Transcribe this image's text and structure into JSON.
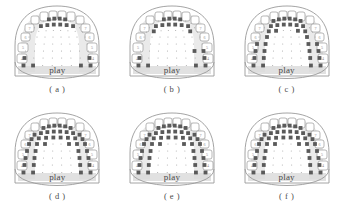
{
  "figure": {
    "type": "electropalatography-palatogram-grid",
    "rows": 2,
    "cols": 3,
    "word": "play",
    "background": "#ffffff",
    "ink": "#4a4a4a",
    "contact_color": "#5a5a5a",
    "outline_color": "#9a9a9a",
    "shade_color": "#d9d9d9"
  },
  "grid_geometry": {
    "rows": 8,
    "cols_per_row": [
      8,
      8,
      8,
      8,
      8,
      8,
      8,
      8
    ],
    "note": "EPG palate electrode grid; filled cells = tongue-palate contact"
  },
  "teeth": {
    "left_labels": [
      "7",
      "6",
      "5",
      "4"
    ],
    "right_labels": [
      "7",
      "6",
      "5",
      "4"
    ]
  },
  "panels": [
    {
      "id": "a",
      "caption": "( a )",
      "word": "play",
      "contacts": [
        [
          0,
          0,
          1,
          1,
          1,
          1,
          0,
          0
        ],
        [
          0,
          1,
          1,
          1,
          1,
          1,
          1,
          0
        ],
        [
          0,
          0,
          0,
          0,
          0,
          0,
          0,
          0
        ],
        [
          0,
          0,
          0,
          0,
          0,
          0,
          0,
          0
        ],
        [
          0,
          0,
          0,
          0,
          0,
          0,
          0,
          0
        ],
        [
          0,
          0,
          0,
          0,
          0,
          0,
          0,
          0
        ],
        [
          1,
          0,
          0,
          0,
          0,
          0,
          0,
          1
        ],
        [
          1,
          1,
          0,
          0,
          0,
          0,
          1,
          1
        ]
      ]
    },
    {
      "id": "b",
      "caption": "( b )",
      "word": "play",
      "contacts": [
        [
          0,
          0,
          1,
          1,
          1,
          1,
          0,
          0
        ],
        [
          0,
          1,
          1,
          1,
          1,
          1,
          1,
          0
        ],
        [
          0,
          1,
          0,
          0,
          0,
          0,
          1,
          0
        ],
        [
          0,
          0,
          0,
          0,
          0,
          0,
          0,
          0
        ],
        [
          0,
          0,
          0,
          0,
          0,
          0,
          0,
          0
        ],
        [
          0,
          0,
          0,
          0,
          0,
          0,
          1,
          1
        ],
        [
          1,
          0,
          0,
          0,
          0,
          0,
          0,
          1
        ],
        [
          1,
          1,
          0,
          0,
          0,
          0,
          1,
          1
        ]
      ]
    },
    {
      "id": "c",
      "caption": "( c )",
      "word": "play",
      "contacts": [
        [
          0,
          1,
          1,
          1,
          1,
          1,
          1,
          0
        ],
        [
          0,
          1,
          1,
          1,
          1,
          1,
          1,
          0
        ],
        [
          0,
          1,
          1,
          0,
          0,
          1,
          1,
          0
        ],
        [
          0,
          1,
          0,
          0,
          0,
          0,
          1,
          0
        ],
        [
          1,
          1,
          0,
          0,
          0,
          0,
          1,
          1
        ],
        [
          1,
          1,
          0,
          0,
          0,
          0,
          1,
          1
        ],
        [
          1,
          1,
          0,
          0,
          0,
          0,
          1,
          1
        ],
        [
          1,
          1,
          0,
          0,
          0,
          0,
          1,
          1
        ]
      ]
    },
    {
      "id": "d",
      "caption": "( d )",
      "word": "play",
      "contacts": [
        [
          0,
          1,
          1,
          1,
          1,
          1,
          1,
          0
        ],
        [
          1,
          1,
          1,
          1,
          1,
          1,
          1,
          1
        ],
        [
          1,
          1,
          1,
          1,
          1,
          1,
          1,
          1
        ],
        [
          1,
          1,
          1,
          0,
          0,
          1,
          1,
          1
        ],
        [
          1,
          1,
          0,
          0,
          0,
          0,
          1,
          1
        ],
        [
          1,
          1,
          0,
          0,
          0,
          0,
          1,
          1
        ],
        [
          1,
          1,
          0,
          0,
          0,
          0,
          1,
          1
        ],
        [
          1,
          1,
          0,
          0,
          0,
          0,
          1,
          1
        ]
      ]
    },
    {
      "id": "e",
      "caption": "( e )",
      "word": "play",
      "contacts": [
        [
          0,
          1,
          1,
          1,
          1,
          1,
          1,
          0
        ],
        [
          1,
          1,
          1,
          1,
          1,
          1,
          1,
          1
        ],
        [
          1,
          1,
          1,
          1,
          1,
          1,
          1,
          1
        ],
        [
          1,
          1,
          1,
          0,
          0,
          1,
          1,
          1
        ],
        [
          1,
          1,
          0,
          0,
          0,
          0,
          1,
          1
        ],
        [
          1,
          1,
          0,
          0,
          0,
          0,
          1,
          1
        ],
        [
          1,
          1,
          0,
          0,
          0,
          0,
          1,
          1
        ],
        [
          1,
          1,
          0,
          0,
          0,
          0,
          1,
          1
        ]
      ]
    },
    {
      "id": "f",
      "caption": "( f )",
      "word": "play",
      "contacts": [
        [
          0,
          1,
          1,
          1,
          1,
          1,
          1,
          0
        ],
        [
          1,
          1,
          1,
          1,
          1,
          1,
          1,
          1
        ],
        [
          1,
          1,
          1,
          1,
          1,
          1,
          1,
          1
        ],
        [
          1,
          1,
          1,
          0,
          0,
          1,
          1,
          1
        ],
        [
          1,
          1,
          0,
          0,
          0,
          0,
          1,
          1
        ],
        [
          1,
          1,
          0,
          0,
          0,
          0,
          1,
          1
        ],
        [
          1,
          1,
          0,
          0,
          0,
          0,
          1,
          1
        ],
        [
          1,
          1,
          0,
          0,
          0,
          0,
          1,
          1
        ]
      ]
    }
  ]
}
